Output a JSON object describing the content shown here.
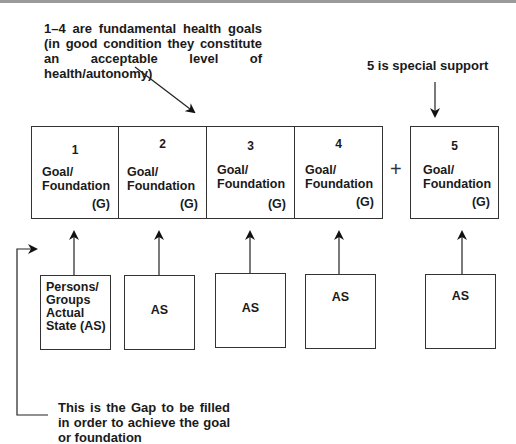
{
  "notes": {
    "fundamental": "1–4 are fundamental health goals (in good condition they constitute an acceptable level of health/autonomy)",
    "special": "5 is special support",
    "gap": "This is the Gap to be filled in order to achieve the goal or foundation"
  },
  "plus_sign": "+",
  "goals": [
    {
      "number": "1",
      "label": "Goal/\nFoundation",
      "tag": "(G)"
    },
    {
      "number": "2",
      "label": "Goal/\nFoundation",
      "tag": "(G)"
    },
    {
      "number": "3",
      "label": "Goal/\nFoundation",
      "tag": "(G)"
    },
    {
      "number": "4",
      "label": "Goal/\nFoundation",
      "tag": "(G)"
    },
    {
      "number": "5",
      "label": "Goal/\nFoundation",
      "tag": "(G)"
    }
  ],
  "actual_states": [
    {
      "label": "Persons/\nGroups\nActual\nState (AS)"
    },
    {
      "label": "AS"
    },
    {
      "label": "AS"
    },
    {
      "label": "AS"
    },
    {
      "label": "AS"
    }
  ]
}
